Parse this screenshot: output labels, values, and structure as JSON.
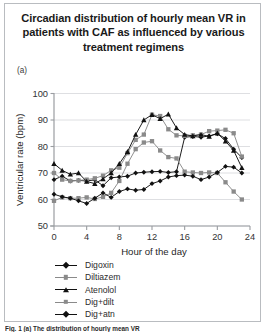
{
  "figure": {
    "title": "Circadian distribution of hourly mean VR in patients with CAF as influenced by various treatment regimens",
    "panel_letter": "(a)",
    "caption": "Fig. 1 (a) The distribution of hourly mean VR"
  },
  "chart_data": {
    "type": "line",
    "title": "Circadian distribution of hourly mean VR in patients with CAF as influenced by various treatment regimens",
    "xlabel": "Hour of the day",
    "ylabel": "Ventricular rate (bpm)",
    "xlim": [
      0,
      24
    ],
    "ylim": [
      50,
      100
    ],
    "xticks": [
      0,
      4,
      8,
      12,
      16,
      20,
      24
    ],
    "yticks": [
      50,
      60,
      70,
      80,
      90,
      100
    ],
    "grid": true,
    "legend_position": "below",
    "x": [
      0,
      1,
      2,
      3,
      4,
      5,
      6,
      7,
      8,
      9,
      10,
      11,
      12,
      13,
      14,
      15,
      16,
      17,
      18,
      19,
      20,
      21,
      22,
      23
    ],
    "series": [
      {
        "name": "Digoxin",
        "color": "#111111",
        "marker": "diamond",
        "values": [
          67.5,
          68.8,
          67.0,
          67.2,
          67.0,
          67.4,
          65.2,
          68.2,
          68.5,
          68.8,
          70.0,
          70.3,
          70.5,
          70.6,
          70.2,
          70.5,
          83.5,
          83.8,
          83.5,
          84.0,
          84.8,
          83.0,
          79.0,
          75.8
        ]
      },
      {
        "name": "Diltiazem",
        "color": "#8a8a8a",
        "marker": "square",
        "values": [
          70.0,
          67.5,
          67.0,
          67.2,
          67.5,
          68.0,
          69.0,
          71.0,
          72.0,
          77.5,
          82.5,
          84.5,
          92.0,
          91.5,
          86.5,
          84.2,
          84.0,
          84.2,
          84.5,
          85.8,
          86.0,
          86.3,
          85.0,
          76.2
        ]
      },
      {
        "name": "Atenolol",
        "color": "#111111",
        "marker": "triangle",
        "values": [
          73.5,
          71.0,
          69.5,
          70.0,
          66.8,
          66.0,
          67.8,
          70.0,
          73.5,
          78.0,
          84.5,
          90.0,
          92.0,
          90.5,
          92.2,
          87.0,
          84.5,
          84.0,
          84.5,
          83.8,
          85.0,
          82.0,
          78.5,
          72.0
        ]
      },
      {
        "name": "Dig+dilt",
        "color": "#8a8a8a",
        "marker": "square",
        "values": [
          59.5,
          60.8,
          60.5,
          60.5,
          60.8,
          60.2,
          61.0,
          62.5,
          67.0,
          73.5,
          79.0,
          81.5,
          82.0,
          78.5,
          76.0,
          75.5,
          70.5,
          70.2,
          70.0,
          70.2,
          70.0,
          66.5,
          63.0,
          60.0
        ]
      },
      {
        "name": "Dig+atn",
        "color": "#111111",
        "marker": "diamond",
        "values": [
          62.0,
          61.0,
          60.5,
          59.5,
          58.5,
          60.5,
          62.5,
          60.8,
          63.0,
          64.0,
          63.5,
          63.8,
          66.0,
          67.0,
          68.5,
          69.0,
          69.2,
          68.8,
          67.5,
          68.5,
          70.2,
          72.5,
          72.2,
          70.0
        ]
      }
    ]
  }
}
